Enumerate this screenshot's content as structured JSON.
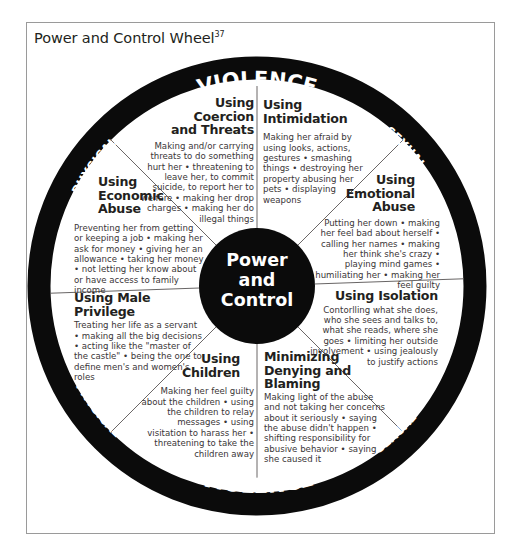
{
  "title": {
    "text": "Power and Control Wheel",
    "superscript": "37"
  },
  "ring": {
    "top": {
      "left": "PHYSICAL",
      "center": "VIOLENCE",
      "right": "SEXUAL"
    },
    "bottom": {
      "left": "PHYSICAL",
      "center": "VIOLENCE",
      "right": "SEXUAL"
    }
  },
  "hub": {
    "line1": "Power",
    "line2": "and",
    "line3": "Control"
  },
  "colors": {
    "ring": "#0b0b0b",
    "hub": "#0b0b0b",
    "text": "#231f20",
    "frame": "#9a9a9a"
  },
  "wedges": [
    {
      "id": "coercion",
      "heading_lines": [
        "Using",
        "Coercion",
        "and Threats"
      ],
      "body": "Making and/or carrying threats to do something hurt her • threatening to leave her, to commit suicide, to report her to welfare • making her drop charges • making her do illegal things"
    },
    {
      "id": "intimidation",
      "heading_lines": [
        "Using",
        "Intimidation"
      ],
      "body": "Making her afraid by using looks, actions, gestures • smashing things • destroying her property abusing her pets • displaying weapons"
    },
    {
      "id": "emotional",
      "heading_lines": [
        "Using",
        "Emotional",
        "Abuse"
      ],
      "body": "Putting her down • making her feel bad about herself • calling her names • making her think she's crazy • playing mind games • humiliating her • making her feel guilty"
    },
    {
      "id": "isolation",
      "heading_lines": [
        "Using Isolation"
      ],
      "body": "Contorlling what she does, who she sees and talks to, what she reads, where she goes • limiting her outside involvement • using jealously to justify actions"
    },
    {
      "id": "minimizing",
      "heading_lines": [
        "Minimizing",
        "Denying and",
        "Blaming"
      ],
      "body": "Making light of the abuse and not taking her concerns about it seriously • saying the abuse didn't happen • shifting responsibility for abusive behavior • saying she caused it"
    },
    {
      "id": "children",
      "heading_lines": [
        "Using",
        "Children"
      ],
      "body": "Making her feel guilty about the children • using the children to relay messages • using visitation to harass her • threatening to take the children away"
    },
    {
      "id": "male-privilege",
      "heading_lines": [
        "Using Male Privilege"
      ],
      "body": "Treating her life as a servant • making all the big decisions • acting like the \"master of the castle\" • being the one to define men's and women's roles"
    },
    {
      "id": "economic",
      "heading_lines": [
        "Using",
        "Economic",
        "Abuse"
      ],
      "body": "Preventing her from getting or keeping a job • making her ask for money • giving her an allowance • taking her money • not letting her know about or have access to family income"
    }
  ]
}
